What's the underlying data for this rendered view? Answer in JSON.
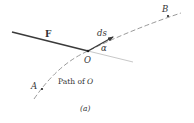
{
  "figure": {
    "caption": "(a)",
    "labels": {
      "force": "F",
      "displacement": "ds",
      "angle": "α",
      "origin": "O",
      "point_a": "A",
      "point_b": "B",
      "path_prefix": "Path of ",
      "path_point": "O"
    },
    "colors": {
      "force_line": "#3a3a3a",
      "ds_arrow": "#3a3a3a",
      "path_dashed": "#9a9a9a",
      "extension_line": "#c8c8c8",
      "text": "#333333"
    }
  }
}
